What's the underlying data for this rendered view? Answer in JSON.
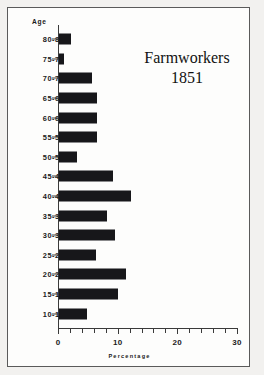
{
  "chart_data": {
    "type": "bar",
    "orientation": "horizontal",
    "title": "Farmworkers",
    "subtitle": "1851",
    "xlabel": "Percentage",
    "ylabel": "Age",
    "xlim": [
      0,
      30
    ],
    "xticks": [
      0,
      10,
      20,
      30
    ],
    "xtick_labels": [
      "0",
      "10",
      "20",
      "30"
    ],
    "minor_tick_step": 2,
    "grid": false,
    "legend": null,
    "bar_color": "#17171a",
    "categories": [
      "80-84",
      "75-79",
      "70-74",
      "65-69",
      "60-64",
      "55-59",
      "50-54",
      "45-49",
      "40-44",
      "35-39",
      "30-34",
      "25-29",
      "20-24",
      "15-19",
      "10-14"
    ],
    "values": [
      2.0,
      0.9,
      5.5,
      6.3,
      6.3,
      6.3,
      3.0,
      9.0,
      12.0,
      8.0,
      9.4,
      6.2,
      11.2,
      9.9,
      4.7
    ]
  },
  "figure": {
    "age_axis_label": "Age",
    "percentage_axis_label": "Percentage"
  }
}
